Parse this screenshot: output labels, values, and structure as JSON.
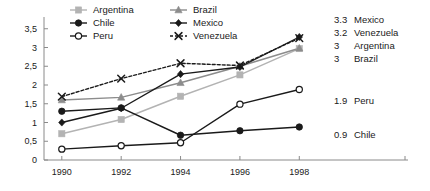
{
  "chart_data": {
    "type": "line",
    "title": "",
    "subtitle": "",
    "xlabel": "",
    "ylabel": "",
    "x": [
      1990,
      1992,
      1994,
      1996,
      1998
    ],
    "xtick_labels": [
      "1990",
      "1992",
      "1994",
      "1996",
      "1998"
    ],
    "ytick_values": [
      0,
      0.5,
      1,
      1.5,
      2,
      2.5,
      3,
      3.5
    ],
    "ytick_labels": [
      "0",
      "0,5",
      "1",
      "1,5",
      "2",
      "2,5",
      "3",
      "3,5"
    ],
    "xlim": [
      1989.4,
      1998.9
    ],
    "ylim": [
      0,
      3.6
    ],
    "grid": false,
    "legend_position": "top",
    "series": [
      {
        "name": "Argentina",
        "values": [
          0.7,
          1.08,
          1.7,
          2.27,
          2.97
        ],
        "color": "#b3b3b3",
        "marker": "square",
        "dash": "none"
      },
      {
        "name": "Brazil",
        "values": [
          1.6,
          1.67,
          2.06,
          2.5,
          2.98
        ],
        "color": "#8c8c8c",
        "marker": "triangle",
        "dash": "none"
      },
      {
        "name": "Chile",
        "values": [
          1.3,
          1.39,
          0.66,
          0.78,
          0.88
        ],
        "color": "#1a1a1a",
        "marker": "circle-filled",
        "dash": "none"
      },
      {
        "name": "Mexico",
        "values": [
          1.0,
          1.38,
          2.29,
          2.48,
          3.28
        ],
        "color": "#1a1a1a",
        "marker": "diamond",
        "dash": "none"
      },
      {
        "name": "Peru",
        "values": [
          0.29,
          0.38,
          0.46,
          1.49,
          1.88
        ],
        "color": "#1a1a1a",
        "marker": "circle-open",
        "dash": "none"
      },
      {
        "name": "Venezuela",
        "values": [
          1.69,
          2.17,
          2.58,
          2.52,
          3.25
        ],
        "color": "#1a1a1a",
        "marker": "x",
        "dash": "3,2"
      }
    ],
    "legend": [
      {
        "label": "Argentina",
        "series": "Argentina",
        "col": 0,
        "row": 0
      },
      {
        "label": "Brazil",
        "series": "Brazil",
        "col": 1,
        "row": 0
      },
      {
        "label": "Chile",
        "series": "Chile",
        "col": 0,
        "row": 1
      },
      {
        "label": "Mexico",
        "series": "Mexico",
        "col": 1,
        "row": 1
      },
      {
        "label": "Peru",
        "series": "Peru",
        "col": 0,
        "row": 2
      },
      {
        "label": "Venezuela",
        "series": "Venezuela",
        "col": 1,
        "row": 2
      }
    ],
    "end_labels": [
      {
        "value": "3.3",
        "name": "Mexico",
        "series": "Mexico"
      },
      {
        "value": "3.2",
        "name": "Venezuela",
        "series": "Venezuela"
      },
      {
        "value": "3",
        "name": "Argentina",
        "series": "Argentina"
      },
      {
        "value": "3",
        "name": "Brazil",
        "series": "Brazil"
      },
      {
        "value": "1.9",
        "name": "Peru",
        "series": "Peru"
      },
      {
        "value": "0.9",
        "name": "Chile",
        "series": "Chile"
      }
    ]
  }
}
